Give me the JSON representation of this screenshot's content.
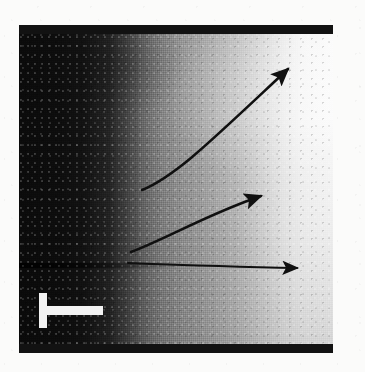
{
  "figure": {
    "type": "grayscale-micrograph",
    "caption": "",
    "panel": {
      "left": 19,
      "top": 25,
      "width": 314,
      "height": 328,
      "gradient_description": "dark at left, brightening continuously to near-white at right"
    },
    "edge_bars": [
      {
        "name": "top-edge-bar",
        "left": 19,
        "top": 25,
        "width": 314,
        "height": 9,
        "color": "#121212"
      },
      {
        "name": "bottom-edge-bar",
        "left": 19,
        "top": 344,
        "width": 314,
        "height": 9,
        "color": "#121212"
      }
    ],
    "arrows": [
      {
        "id": "upper-arrow",
        "label": "upper curved arrow",
        "style": "curved",
        "color": "#101010",
        "start": {
          "x": 142,
          "y": 190
        },
        "control": {
          "x": 210,
          "y": 150
        },
        "end": {
          "x": 292,
          "y": 66
        }
      },
      {
        "id": "middle-arrow",
        "label": "middle arrow",
        "style": "slightly-curved",
        "color": "#101010",
        "start": {
          "x": 131,
          "y": 252
        },
        "control": {
          "x": 200,
          "y": 218
        },
        "end": {
          "x": 265,
          "y": 194
        }
      },
      {
        "id": "lower-arrow",
        "label": "lower horizontal arrow",
        "style": "near-straight",
        "color": "#101010",
        "start": {
          "x": 128,
          "y": 263
        },
        "control": {
          "x": 215,
          "y": 266
        },
        "end": {
          "x": 302,
          "y": 268
        }
      }
    ],
    "scale_bar": {
      "name": "scale-bar",
      "shape": "rotated-T",
      "color": "#f2f2f2",
      "left": 39,
      "top": 293,
      "stem_length": 35,
      "arm_length": 64,
      "stroke": 9,
      "label": ""
    },
    "background_color": "#fbfbfa"
  },
  "accessibility": {
    "figure_alt": "Grayscale micrograph with a left-to-right dark-to-light intensity gradient, dark horizontal bands across the top and bottom, three black arrows fanning out to the right from a common origin, and a white T-shaped scale bar in the lower left."
  }
}
